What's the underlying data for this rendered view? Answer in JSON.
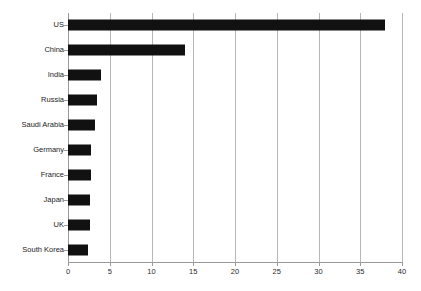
{
  "chart_data": {
    "type": "bar",
    "orientation": "horizontal",
    "title": "",
    "subtitle": "",
    "xlabel": "",
    "ylabel": "",
    "categories": [
      "US",
      "China",
      "India",
      "Russia",
      "Saudi Arabia",
      "Germany",
      "France",
      "Japan",
      "UK",
      "South Korea"
    ],
    "values": [
      38,
      14,
      3.9,
      3.5,
      3.2,
      2.7,
      2.7,
      2.6,
      2.6,
      2.4
    ],
    "series": [
      {
        "name": "",
        "values": [
          38,
          14,
          3.9,
          3.5,
          3.2,
          2.7,
          2.7,
          2.6,
          2.6,
          2.4
        ]
      }
    ],
    "xlim": [
      0,
      40
    ],
    "xticks": [
      0,
      5,
      10,
      15,
      20,
      25,
      30,
      35,
      40
    ],
    "xtick_labels": [
      "0",
      "5",
      "10",
      "15",
      "20",
      "25",
      "30",
      "35",
      "40"
    ],
    "grid": "vertical",
    "legend": "none",
    "bar_color": "#111111",
    "gridline_color": "#b6b6b6",
    "background_color": "#ffffff",
    "annotations": []
  }
}
